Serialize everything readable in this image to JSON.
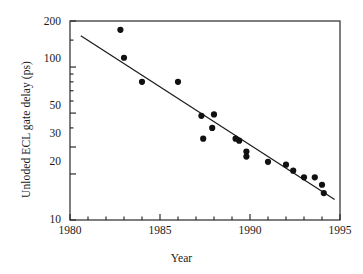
{
  "chart_data": {
    "type": "scatter",
    "title": "",
    "subtitle": "",
    "xlabel": "Year",
    "ylabel": "Unloded ECL gate delay (ps)",
    "xlim": [
      1980,
      1995
    ],
    "ylim": [
      10,
      200
    ],
    "yscale": "log",
    "xscale": "linear",
    "grid": false,
    "legend": null,
    "xticks": [
      1980,
      1985,
      1990,
      1995
    ],
    "xtick_labels": [
      "1980",
      "1985",
      "1990",
      "1995"
    ],
    "xminor_interval": 1,
    "yticks": [
      10,
      20,
      30,
      50,
      100,
      200
    ],
    "ytick_labels": [
      "10",
      "20",
      "30",
      "50",
      "100",
      "200"
    ],
    "yminor_ticks": [
      40,
      60,
      70,
      80,
      90,
      150
    ],
    "marker": "filled-circle",
    "marker_color": "#111111",
    "marker_size_px": 5,
    "series": [
      {
        "name": "Unloaded ECL gate delay",
        "points": [
          {
            "x": 1982.8,
            "y": 175
          },
          {
            "x": 1983.0,
            "y": 115
          },
          {
            "x": 1984.0,
            "y": 80
          },
          {
            "x": 1986.0,
            "y": 80
          },
          {
            "x": 1987.3,
            "y": 48
          },
          {
            "x": 1988.0,
            "y": 49
          },
          {
            "x": 1987.9,
            "y": 40
          },
          {
            "x": 1987.4,
            "y": 34
          },
          {
            "x": 1989.2,
            "y": 34
          },
          {
            "x": 1989.4,
            "y": 33
          },
          {
            "x": 1989.8,
            "y": 28
          },
          {
            "x": 1989.8,
            "y": 26
          },
          {
            "x": 1991.0,
            "y": 24
          },
          {
            "x": 1992.0,
            "y": 23
          },
          {
            "x": 1992.4,
            "y": 21
          },
          {
            "x": 1993.0,
            "y": 19
          },
          {
            "x": 1993.6,
            "y": 19
          },
          {
            "x": 1994.0,
            "y": 17
          },
          {
            "x": 1994.1,
            "y": 15
          }
        ]
      }
    ],
    "trendline": {
      "name": "fit-line",
      "type": "log-linear",
      "x_start": 1980.6,
      "y_start": 160,
      "x_end": 1994.7,
      "y_end": 13.6,
      "color": "#1a1a1a",
      "width_px": 1.2
    }
  },
  "frame": {
    "color": "#2a2a2a",
    "width_px": 1.2,
    "background": "#ffffff"
  }
}
